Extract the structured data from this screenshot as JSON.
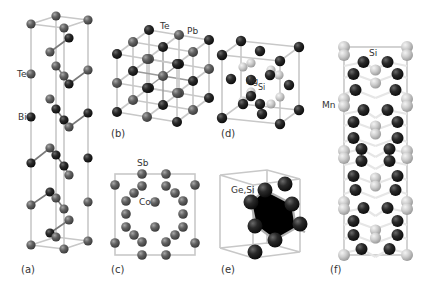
{
  "figure": {
    "panels": [
      {
        "id": "a",
        "label": "(a)",
        "compound": "Bi2Te3",
        "atom_labels": [
          "Te",
          "Bi"
        ]
      },
      {
        "id": "b",
        "label": "(b)",
        "compound": "PbTe",
        "atom_labels": [
          "Te",
          "Pb"
        ]
      },
      {
        "id": "c",
        "label": "(c)",
        "compound": "CoSb3",
        "atom_labels": [
          "Sb",
          "Co"
        ]
      },
      {
        "id": "d",
        "label": "(d)",
        "compound": "Mg2Si",
        "atom_labels": [
          "Mg",
          "Si"
        ]
      },
      {
        "id": "e",
        "label": "(e)",
        "compound": "Ge,Si",
        "atom_labels": [
          "Ge,Si"
        ]
      },
      {
        "id": "f",
        "label": "(f)",
        "compound": "Higher manganese silicide",
        "atom_labels": [
          "Si",
          "Mn"
        ]
      }
    ]
  },
  "colors": {
    "dark_atom": "#1e1e1e",
    "mid_atom": "#5a5a5a",
    "light_atom": "#cfcfcf",
    "cell_edge": "#c8c8c8",
    "label_text": "#333333"
  }
}
